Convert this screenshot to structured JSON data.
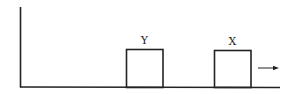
{
  "diagram": {
    "blocks": [
      {
        "label": "Y",
        "x": 126,
        "y": 49,
        "w": 37,
        "h": 38
      },
      {
        "label": "X",
        "x": 214,
        "y": 50,
        "w": 37,
        "h": 37
      }
    ],
    "arrow": {
      "direction": "right"
    },
    "colors": {
      "stroke": "#222222",
      "background": "#ffffff"
    }
  }
}
